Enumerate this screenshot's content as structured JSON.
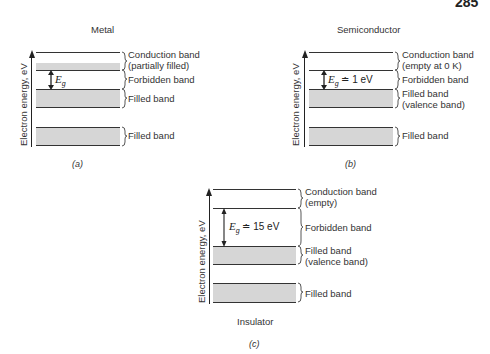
{
  "page_number": "285",
  "axis_label": "Electron energy, eV",
  "panels": {
    "metal": {
      "title": "Metal",
      "caption": "(a)",
      "gap_label": "E",
      "gap_sub": "g",
      "gap_value": "",
      "labels": {
        "conduction": "Conduction band",
        "conduction_note": "(partially filled)",
        "forbidden": "Forbidden band",
        "filled1": "Filled band",
        "filled1_note": "",
        "filled2": "Filled band"
      }
    },
    "semiconductor": {
      "title": "Semiconductor",
      "caption": "(b)",
      "gap_label": "E",
      "gap_sub": "g",
      "gap_value": " ≐ 1 eV",
      "labels": {
        "conduction": "Conduction band",
        "conduction_note": "(empty at 0 K)",
        "forbidden": "Forbidden band",
        "filled1": "Filled band",
        "filled1_note": "(valence band)",
        "filled2": "Filled band"
      }
    },
    "insulator": {
      "title": "Insulator",
      "caption": "(c)",
      "gap_label": "E",
      "gap_sub": "g",
      "gap_value": " ≐ 15 eV",
      "labels": {
        "conduction": "Conduction band",
        "conduction_note": "(empty)",
        "forbidden": "Forbidden band",
        "filled1": "Filled band",
        "filled1_note": "(valence band)",
        "filled2": "Filled band"
      }
    }
  },
  "colors": {
    "band_fill": "#d6d6d6",
    "line": "#333333"
  }
}
